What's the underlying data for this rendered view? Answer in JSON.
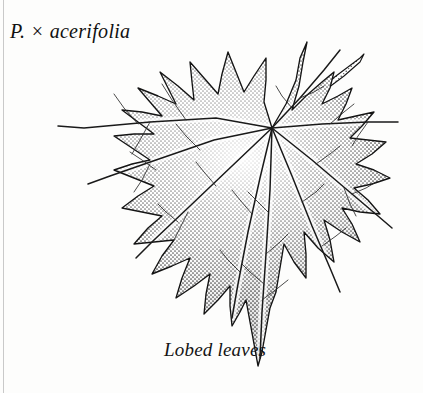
{
  "plate": {
    "background_color": "#fdfdfc",
    "ink_color": "#111111",
    "rule_color": "#c9c9c9",
    "species_label": "P. × acerifolia",
    "caption": "Lobed leaves",
    "subject": "london-plane-leaf",
    "technique": "stipple-pen-and-ink"
  },
  "figure": {
    "leaf": {
      "name": "palmately-lobed-leaf",
      "lobe_count": 5,
      "vein_origin": [
        272,
        128
      ],
      "outline": "M272,128 L286,104 L296,80 L300,58 L307,42 L303,62 L299,86 L292,110 L306,96 L322,82 L334,72 L330,88 L322,104 L338,96 L352,88 L346,104 L338,120 L356,116 L374,112 L362,126 L350,138 L368,140 L386,142 L372,154 L356,164 L374,170 L390,178 L372,184 L354,188 L368,200 L380,214 L360,212 L342,208 L352,224 L360,242 L342,232 L324,220 L330,240 L334,262 L318,248 L304,232 L306,254 L306,278 L294,262 L284,244 L280,268 L276,292 L270,308 L266,330 L262,352 L258,366 L254,344 L250,322 L246,300 L240,312 L232,326 L230,306 L230,286 L218,300 L204,314 L206,294 L210,274 L194,286 L176,298 L182,278 L190,258 L172,266 L152,274 L162,256 L174,240 L154,242 L134,244 L148,228 L162,216 L142,212 L122,208 L138,196 L154,186 L134,178 L114,170 L132,164 L150,160 L132,148 L114,136 L134,134 L154,134 L138,122 L122,110 L142,112 L162,116 L150,102 L138,88 L158,96 L176,104 L168,88 L160,72 L178,86 L194,100 L192,82 L190,62 L204,78 L218,94 L222,74 L228,52 L236,72 L244,92 L254,76 L266,58 L266,80 L264,102 Z",
      "ribs": [
        {
          "name": "rib-upper-left",
          "path": "M272,128 L216,118 L150,122 L84,128 L58,126"
        },
        {
          "name": "rib-left-upper-mid",
          "path": "M272,128 L214,140 L156,160 L110,176 L88,184"
        },
        {
          "name": "rib-left-lower",
          "path": "M272,128 L232,166 L190,206 L154,240 L136,258"
        },
        {
          "name": "rib-lower-left",
          "path": "M272,128 L260,178 L248,232 L238,284 L232,318"
        },
        {
          "name": "rib-midrib",
          "path": "M272,128 L270,190 L266,254 L262,312 L260,358"
        },
        {
          "name": "rib-lower-right",
          "path": "M272,128 L292,176 L312,226 L330,268 L340,292"
        },
        {
          "name": "rib-right-lower",
          "path": "M272,128 L312,160 L352,194 L378,216 L392,228"
        },
        {
          "name": "rib-right-upper",
          "path": "M272,128 L322,124 L368,122 L398,122"
        },
        {
          "name": "rib-upper-right",
          "path": "M272,128 L300,98 L324,70 L340,50"
        }
      ],
      "secondary_veins": [
        {
          "name": "vein-ul-a",
          "path": "M186,120 L172,100 L162,84"
        },
        {
          "name": "vein-ul-b",
          "path": "M138,124 L124,108 L114,94"
        },
        {
          "name": "vein-ul-c",
          "path": "M150,122 L140,140 L132,154"
        },
        {
          "name": "vein-lm-a",
          "path": "M200,150 L186,136 L176,124"
        },
        {
          "name": "vein-lm-b",
          "path": "M156,170 L142,160 L130,152"
        },
        {
          "name": "vein-lm-c",
          "path": "M150,164 L142,180 L134,192"
        },
        {
          "name": "vein-ll-a",
          "path": "M216,186 L204,172 L196,162"
        },
        {
          "name": "vein-ll-b",
          "path": "M178,222 L166,212 L158,204"
        },
        {
          "name": "vein-ll-c",
          "path": "M188,212 L180,228 L174,240"
        },
        {
          "name": "vein-bl-a",
          "path": "M252,214 L240,200 L232,190"
        },
        {
          "name": "vein-bl-b",
          "path": "M240,272 L228,260 L220,250"
        },
        {
          "name": "vein-mid-a",
          "path": "M268,212 L256,200 L248,192"
        },
        {
          "name": "vein-mid-b",
          "path": "M266,254 L280,242 L288,234"
        },
        {
          "name": "vein-mid-c",
          "path": "M264,284 L250,272 L242,264"
        },
        {
          "name": "vein-mid-d",
          "path": "M262,300 L278,288 L288,280"
        },
        {
          "name": "vein-br-a",
          "path": "M302,202 L316,192 L324,184"
        },
        {
          "name": "vein-br-b",
          "path": "M322,246 L336,236 L346,228"
        },
        {
          "name": "vein-rl-a",
          "path": "M316,164 L330,154 L340,146"
        },
        {
          "name": "vein-rl-b",
          "path": "M352,194 L366,188 L376,182"
        },
        {
          "name": "vein-rl-c",
          "path": "M344,188 L350,204 L356,216"
        },
        {
          "name": "vein-ru-a",
          "path": "M330,124 L344,112 L354,104"
        },
        {
          "name": "vein-ru-b",
          "path": "M368,122 L358,136 L352,146"
        },
        {
          "name": "vein-ur-a",
          "path": "M300,98 L314,92 L324,86"
        },
        {
          "name": "vein-ur-b",
          "path": "M292,108 L282,96 L276,86"
        }
      ]
    },
    "petiole": {
      "name": "leaf-stalk",
      "path": "M272,128 L296,108 L320,88 L344,70 L360,58 L364,54 L360,62 L344,76 L320,94 L296,114 L274,132 Z",
      "tip": [
        364,
        54
      ]
    }
  }
}
